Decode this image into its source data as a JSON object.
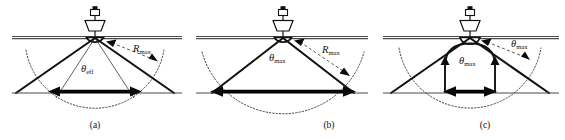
{
  "figure": {
    "background_color": "#ffffff",
    "ink_color": "#111111"
  },
  "panels": [
    {
      "id": "a",
      "caption": "(a)",
      "angle_label": {
        "symbol": "θ",
        "subscript": "eff",
        "full": "θeff"
      },
      "range_label": {
        "symbol": "R",
        "subscript": "max",
        "full": "Rmax"
      },
      "description": "Beam rays extend past the maximum-range arc; swath limited by effective angle",
      "swath_width_relative": "medium",
      "has_inner_curve": false,
      "arc_style": "dotted",
      "ray_terminates_at": "beyond-arc"
    },
    {
      "id": "b",
      "caption": "(b)",
      "angle_label": {
        "symbol": "θ",
        "subscript": "max",
        "full": "θmax"
      },
      "range_label": {
        "symbol": "R",
        "subscript": "max",
        "full": "Rmax"
      },
      "description": "Beam rays terminate on the maximum-range arc; widest seafloor swath",
      "swath_width_relative": "widest",
      "has_inner_curve": false,
      "arc_style": "dotted",
      "ray_terminates_at": "on-arc"
    },
    {
      "id": "c",
      "caption": "(c)",
      "angle_label": {
        "symbol": "θ",
        "subscript": "max",
        "full": "θmax"
      },
      "angle_label_outer": {
        "symbol": "θ",
        "subscript": "max",
        "full": "θmax"
      },
      "description": "Bell-shaped inner coverage envelope narrows the usable swath",
      "swath_width_relative": "narrowest",
      "has_inner_curve": true,
      "arc_style": "dotted",
      "ray_terminates_at": "beyond-arc"
    }
  ],
  "elements": {
    "sea_surface": "sea-surface-line",
    "seafloor": "seafloor-line",
    "ship": "ship-icon",
    "transducer": "transducer-icon",
    "swath_arrow": "swath-extent-arrow",
    "range_arc": "max-range-arc"
  }
}
